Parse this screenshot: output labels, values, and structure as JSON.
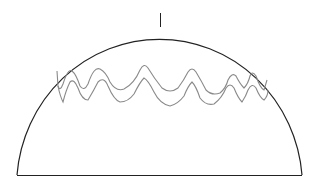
{
  "figure": {
    "colors": {
      "outline": "#222222",
      "band": "#8a8a8a",
      "background": "#ffffff"
    },
    "shapes": [
      "dome-outline",
      "stem",
      "base-line",
      "wavy-band-upper",
      "wavy-band-lower"
    ]
  }
}
